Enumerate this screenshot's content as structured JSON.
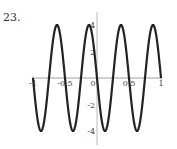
{
  "problem": {
    "number": "23."
  },
  "chart_data": {
    "type": "line",
    "title": "",
    "xlabel": "",
    "ylabel": "",
    "xlim": [
      -1,
      1
    ],
    "ylim": [
      -4.3,
      4.3
    ],
    "grid": false,
    "legend": null,
    "function": "y = -4 sin(4πx)",
    "x_ticks": [
      -1,
      -0.5,
      0,
      0.5,
      1
    ],
    "x_tick_labels": [
      "-1",
      "-0.5",
      "0",
      "0.5",
      "1"
    ],
    "y_ticks": [
      4,
      2,
      -2,
      -4
    ],
    "y_tick_labels": [
      "4",
      "2",
      "-2",
      "-4"
    ],
    "series": [
      {
        "name": "curve",
        "color": "#222222",
        "x": [
          -1,
          -0.875,
          -0.75,
          -0.625,
          -0.5,
          -0.375,
          -0.25,
          -0.125,
          0,
          0.125,
          0.25,
          0.375,
          0.5,
          0.625,
          0.75,
          0.875,
          1
        ],
        "values": [
          0,
          -4,
          0,
          4,
          0,
          -4,
          0,
          4,
          0,
          -4,
          0,
          4,
          0,
          -4,
          0,
          4,
          0
        ]
      }
    ]
  }
}
